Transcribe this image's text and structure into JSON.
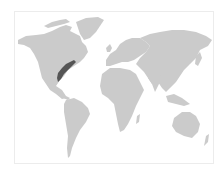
{
  "map": {
    "type": "world-choropleth",
    "colors": {
      "land": "#cbcbcb",
      "highlight": "#555555",
      "border": "#ececec",
      "background": "#ffffff"
    },
    "highlighted_regions": [
      "Northeastern United States / Southern Ontario-Quebec"
    ]
  }
}
